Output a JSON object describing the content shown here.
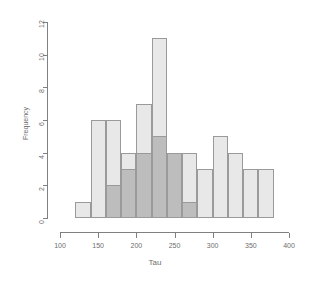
{
  "chart_data": {
    "type": "bar",
    "title": "",
    "xlabel": "Tau",
    "ylabel": "Frequency",
    "xlim": [
      100,
      400
    ],
    "ylim": [
      0,
      12
    ],
    "xticks": [
      100,
      150,
      200,
      250,
      300,
      350,
      400
    ],
    "yticks": [
      0,
      2,
      4,
      6,
      8,
      10,
      12
    ],
    "xtick_labels": [
      "100",
      "150",
      "200",
      "250",
      "300",
      "350",
      "400"
    ],
    "ytick_labels": [
      "0",
      "2",
      "4",
      "6",
      "8",
      "10",
      "12"
    ],
    "grid": false,
    "legend": "none",
    "bin_width": 20,
    "series": [
      {
        "name": "light",
        "color": "#e8e8e8",
        "border": "#9a9a9a",
        "bin_starts": [
          120,
          140,
          160,
          180,
          200,
          220,
          240,
          260,
          280,
          300,
          320,
          340,
          360
        ],
        "values": [
          1,
          6,
          6,
          4,
          7,
          11,
          4,
          4,
          3,
          5,
          4,
          3,
          3
        ]
      },
      {
        "name": "dark",
        "color": "#bdbdbd",
        "border": "#9a9a9a",
        "bin_starts": [
          160,
          180,
          200,
          220,
          240,
          260
        ],
        "values": [
          2,
          3,
          4,
          5,
          4,
          1
        ]
      }
    ]
  }
}
